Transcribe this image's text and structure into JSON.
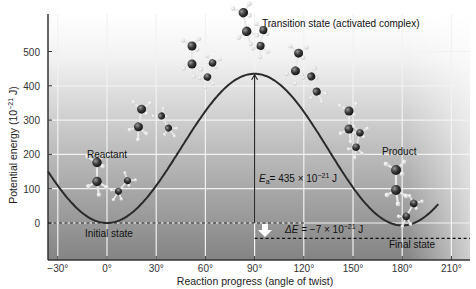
{
  "chart_data": {
    "type": "line",
    "title": "Transition state (activated complex)",
    "xlabel": "Reaction progress (angle of twist)",
    "ylabel": "Potential energy (10^-21 J)",
    "ylabel_base": "Potential energy (10",
    "ylabel_exp": "−21",
    "ylabel_tail": " J)",
    "x_ticks": [
      -30,
      0,
      30,
      60,
      90,
      120,
      150,
      180,
      210
    ],
    "x_tick_labels": [
      "−30°",
      "0°",
      "30°",
      "60°",
      "90°",
      "120°",
      "150°",
      "180°",
      "210°"
    ],
    "y_ticks": [
      0,
      100,
      200,
      300,
      400,
      500
    ],
    "y_tick_labels": [
      "0",
      "100",
      "200",
      "300",
      "400",
      "500"
    ],
    "xlim": [
      -36,
      202
    ],
    "ylim": [
      -110,
      560
    ],
    "grid": true,
    "series": [
      {
        "name": "Potential energy",
        "x": [
          -36,
          -30,
          -15,
          0,
          15,
          30,
          45,
          60,
          75,
          90,
          105,
          120,
          135,
          150,
          165,
          180,
          195,
          202
        ],
        "values": [
          150,
          109,
          29,
          0,
          29,
          109,
          218,
          326,
          406,
          435,
          406,
          325,
          214,
          104,
          23,
          -7,
          23,
          64
        ]
      }
    ],
    "annotations": {
      "transition_state": "Transition state (activated complex)",
      "reactant": "Reactant",
      "product": "Product",
      "initial_state": "Initial state",
      "final_state": "Final state",
      "ea_label_E": "E",
      "ea_label_sub": "a",
      "ea_label_rest": "= 435 × 10",
      "ea_label_exp": "−21",
      "ea_label_unit": " J",
      "de_label_prefix": "ΔE",
      "de_label_rest": " = −7 × 10",
      "de_label_exp": "−21",
      "de_label_unit": " J",
      "activation_energy": 435,
      "delta_e": -7,
      "initial_energy": 0,
      "final_energy": -7,
      "peak_angle": 90
    },
    "colors": {
      "curve": "#2a2a2a",
      "background_top": "#ffffff",
      "background_bottom": "#848484",
      "grid": "#f2f2f2",
      "atom_carbon": "#2c2c2c",
      "atom_hydrogen": "#f4f4f4"
    }
  }
}
